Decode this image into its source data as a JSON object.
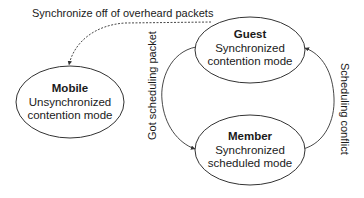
{
  "diagram": {
    "type": "state-diagram",
    "nodes": [
      {
        "id": "guest",
        "title": "Guest",
        "line1": "Synchronized",
        "line2": "contention mode"
      },
      {
        "id": "mobile",
        "title": "Mobile",
        "line1": "Unsynchronized",
        "line2": "contention mode"
      },
      {
        "id": "member",
        "title": "Member",
        "line1": "Synchronized",
        "line2": "scheduled mode"
      }
    ],
    "edges": [
      {
        "from": "guest",
        "to": "mobile",
        "style": "dashed",
        "label": "Synchronize off of overheard packets"
      },
      {
        "from": "guest",
        "to": "member",
        "style": "solid",
        "label": "Got scheduling packet"
      },
      {
        "from": "member",
        "to": "guest",
        "style": "solid",
        "label": "Scheduling conflict"
      }
    ]
  },
  "colors": {
    "stroke": "#333333",
    "text": "#1a1a1a",
    "background": "#ffffff"
  }
}
